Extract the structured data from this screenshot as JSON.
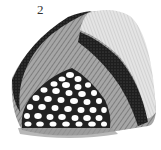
{
  "figure": {
    "label": "2",
    "colors": {
      "background": "#ffffff",
      "ink_dark": "#1a1a1a",
      "hatch_mid": "#8a8a8a",
      "hatch_light": "#d6d6d6",
      "cell_fill": "#ffffff"
    }
  }
}
